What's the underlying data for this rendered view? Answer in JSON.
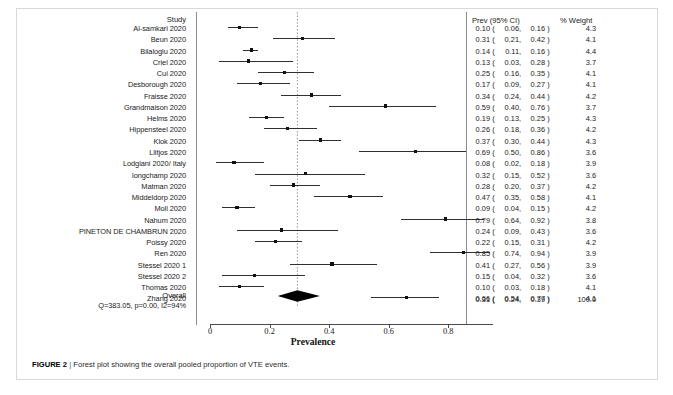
{
  "figure": {
    "caption_label": "FIGURE 2",
    "caption_separator": "|",
    "caption_text": "Forest plot showing the overall pooled proportion of VTE events."
  },
  "headers": {
    "study": "Study",
    "prev": "Prev (95% CI)",
    "weight": "% Weight"
  },
  "overall": {
    "label": "Overall",
    "heterogeneity": "Q=383.05, p=0.00, I2=94%",
    "prev_text": "0.31 (  0.24,  0.39)",
    "est": "0.31",
    "lo": "0.24",
    "hi": "0.39",
    "weight": "100.0"
  },
  "axis": {
    "title": "Prevalence",
    "ticks": [
      "0",
      "0.2",
      "0.4",
      "0.6",
      "0.8"
    ],
    "tick_values": [
      0,
      0.2,
      0.4,
      0.6,
      0.8
    ],
    "min": 0,
    "max": 0.95,
    "reference_line": 0.31
  },
  "chart_data": {
    "type": "forest",
    "title": "Forest plot showing the overall pooled proportion of VTE events.",
    "xlabel": "Prevalence",
    "ylabel": "Study",
    "xlim": [
      0,
      0.95
    ],
    "xticks": [
      0,
      0.2,
      0.4,
      0.6,
      0.8
    ],
    "grid": false,
    "reference_line": 0.31,
    "effect_measure": "Prevalence (proportion)",
    "heterogeneity": {
      "Q": 383.05,
      "p": 0.0,
      "I2": "94%"
    },
    "pooled": {
      "estimate": 0.31,
      "ci_low": 0.24,
      "ci_high": 0.39,
      "weight": 100.0
    },
    "rows": [
      {
        "study": "Al-samkari 2020",
        "est": 0.1,
        "lo": 0.06,
        "hi": 0.16,
        "weight": 4.3,
        "est_text": "0.10",
        "lo_text": "0.06",
        "hi_text": "0.16",
        "weight_text": "4.3"
      },
      {
        "study": "Beun 2020",
        "est": 0.31,
        "lo": 0.21,
        "hi": 0.42,
        "weight": 4.1,
        "est_text": "0.31",
        "lo_text": "0.21",
        "hi_text": "0.42",
        "weight_text": "4.1"
      },
      {
        "study": "Bilaloglu 2020",
        "est": 0.14,
        "lo": 0.11,
        "hi": 0.16,
        "weight": 4.4,
        "est_text": "0.14",
        "lo_text": "0.11",
        "hi_text": "0.16",
        "weight_text": "4.4"
      },
      {
        "study": "Criel 2020",
        "est": 0.13,
        "lo": 0.03,
        "hi": 0.28,
        "weight": 3.7,
        "est_text": "0.13",
        "lo_text": "0.03",
        "hi_text": "0.28",
        "weight_text": "3.7"
      },
      {
        "study": "Cui 2020",
        "est": 0.25,
        "lo": 0.16,
        "hi": 0.35,
        "weight": 4.1,
        "est_text": "0.25",
        "lo_text": "0.16",
        "hi_text": "0.35",
        "weight_text": "4.1"
      },
      {
        "study": "Desborough 2020",
        "est": 0.17,
        "lo": 0.09,
        "hi": 0.27,
        "weight": 4.1,
        "est_text": "0.17",
        "lo_text": "0.09",
        "hi_text": "0.27",
        "weight_text": "4.1"
      },
      {
        "study": "Fraisse 2020",
        "est": 0.34,
        "lo": 0.24,
        "hi": 0.44,
        "weight": 4.2,
        "est_text": "0.34",
        "lo_text": "0.24",
        "hi_text": "0.44",
        "weight_text": "4.2"
      },
      {
        "study": "Grandmaison 2020",
        "est": 0.59,
        "lo": 0.4,
        "hi": 0.76,
        "weight": 3.7,
        "est_text": "0.59",
        "lo_text": "0.40",
        "hi_text": "0.76",
        "weight_text": "3.7"
      },
      {
        "study": "Helms 2020",
        "est": 0.19,
        "lo": 0.13,
        "hi": 0.25,
        "weight": 4.3,
        "est_text": "0.19",
        "lo_text": "0.13",
        "hi_text": "0.25",
        "weight_text": "4.3"
      },
      {
        "study": "Hippensteel 2020",
        "est": 0.26,
        "lo": 0.18,
        "hi": 0.36,
        "weight": 4.2,
        "est_text": "0.26",
        "lo_text": "0.18",
        "hi_text": "0.36",
        "weight_text": "4.2"
      },
      {
        "study": "Klok 2020",
        "est": 0.37,
        "lo": 0.3,
        "hi": 0.44,
        "weight": 4.3,
        "est_text": "0.37",
        "lo_text": "0.30",
        "hi_text": "0.44",
        "weight_text": "4.3"
      },
      {
        "study": "Llitjos 2020",
        "est": 0.69,
        "lo": 0.5,
        "hi": 0.86,
        "weight": 3.6,
        "est_text": "0.69",
        "lo_text": "0.50",
        "hi_text": "0.86",
        "weight_text": "3.6"
      },
      {
        "study": "Lodgiani 2020/ Italy",
        "est": 0.08,
        "lo": 0.02,
        "hi": 0.18,
        "weight": 3.9,
        "est_text": "0.08",
        "lo_text": "0.02",
        "hi_text": "0.18",
        "weight_text": "3.9"
      },
      {
        "study": "longchamp 2020",
        "est": 0.32,
        "lo": 0.15,
        "hi": 0.52,
        "weight": 3.6,
        "est_text": "0.32",
        "lo_text": "0.15",
        "hi_text": "0.52",
        "weight_text": "3.6"
      },
      {
        "study": "Matman 2020",
        "est": 0.28,
        "lo": 0.2,
        "hi": 0.37,
        "weight": 4.2,
        "est_text": "0.28",
        "lo_text": "0.20",
        "hi_text": "0.37",
        "weight_text": "4.2"
      },
      {
        "study": "Middeldorp 2020",
        "est": 0.47,
        "lo": 0.35,
        "hi": 0.58,
        "weight": 4.1,
        "est_text": "0.47",
        "lo_text": "0.35",
        "hi_text": "0.58",
        "weight_text": "4.1"
      },
      {
        "study": "Moll 2020",
        "est": 0.09,
        "lo": 0.04,
        "hi": 0.15,
        "weight": 4.2,
        "est_text": "0.09",
        "lo_text": "0.04",
        "hi_text": "0.15",
        "weight_text": "4.2"
      },
      {
        "study": "Nahum 2020",
        "est": 0.79,
        "lo": 0.64,
        "hi": 0.92,
        "weight": 3.8,
        "est_text": "0.79",
        "lo_text": "0.64",
        "hi_text": "0.92",
        "weight_text": "3.8"
      },
      {
        "study": "PINETON DE CHAMBRUN 2020",
        "est": 0.24,
        "lo": 0.09,
        "hi": 0.43,
        "weight": 3.6,
        "est_text": "0.24",
        "lo_text": "0.09",
        "hi_text": "0.43",
        "weight_text": "3.6"
      },
      {
        "study": "Poissy 2020",
        "est": 0.22,
        "lo": 0.15,
        "hi": 0.31,
        "weight": 4.2,
        "est_text": "0.22",
        "lo_text": "0.15",
        "hi_text": "0.31",
        "weight_text": "4.2"
      },
      {
        "study": "Ren 2020",
        "est": 0.85,
        "lo": 0.74,
        "hi": 0.94,
        "weight": 3.9,
        "est_text": "0.85",
        "lo_text": "0.74",
        "hi_text": "0.94",
        "weight_text": "3.9"
      },
      {
        "study": "Stessel 2020 1",
        "est": 0.41,
        "lo": 0.27,
        "hi": 0.56,
        "weight": 3.9,
        "est_text": "0.41",
        "lo_text": "0.27",
        "hi_text": "0.56",
        "weight_text": "3.9"
      },
      {
        "study": "Stessel 2020 2",
        "est": 0.15,
        "lo": 0.04,
        "hi": 0.32,
        "weight": 3.6,
        "est_text": "0.15",
        "lo_text": "0.04",
        "hi_text": "0.32",
        "weight_text": "3.6"
      },
      {
        "study": "Thomas 2020",
        "est": 0.1,
        "lo": 0.03,
        "hi": 0.18,
        "weight": 4.1,
        "est_text": "0.10",
        "lo_text": "0.03",
        "hi_text": "0.18",
        "weight_text": "4.1"
      },
      {
        "study": "Zhang 2020",
        "est": 0.66,
        "lo": 0.54,
        "hi": 0.77,
        "weight": 4.1,
        "est_text": "0.66",
        "lo_text": "0.54",
        "hi_text": "0.77",
        "weight_text": "4.1"
      }
    ]
  }
}
